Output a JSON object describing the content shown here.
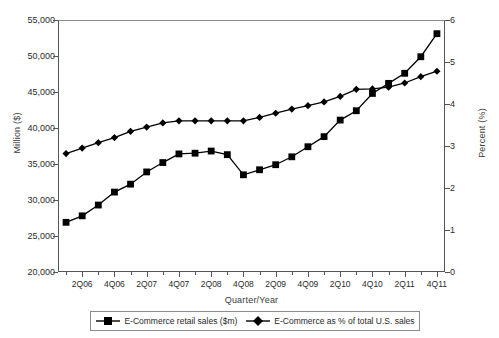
{
  "chart_data": {
    "type": "line",
    "title": "",
    "xlabel": "Quarter/Year",
    "ylabel": "Million ($)",
    "y2label": "Percent (%)",
    "ylim": [
      20000,
      55000
    ],
    "y2lim": [
      0,
      6
    ],
    "ytick_labels": [
      "55,000",
      "50,000",
      "45,000",
      "40,000",
      "35,000",
      "30,000",
      "25,000",
      "20,000"
    ],
    "ytick_values": [
      55000,
      50000,
      45000,
      40000,
      35000,
      30000,
      25000,
      20000
    ],
    "y2tick_labels": [
      "6",
      "5",
      "4",
      "3",
      "2",
      "1",
      "0"
    ],
    "y2tick_values": [
      6,
      5,
      4,
      3,
      2,
      1,
      0
    ],
    "grid": false,
    "legend_position": "bottom",
    "x": [
      "1Q06",
      "2Q06",
      "3Q06",
      "4Q06",
      "1Q07",
      "2Q07",
      "3Q07",
      "4Q07",
      "1Q08",
      "2Q08",
      "3Q08",
      "4Q08",
      "1Q09",
      "2Q09",
      "3Q09",
      "4Q09",
      "1Q10",
      "2Q10",
      "3Q10",
      "4Q10",
      "1Q11",
      "2Q11",
      "3Q11",
      "4Q11"
    ],
    "xtick_labels": [
      "2Q06",
      "4Q06",
      "2Q07",
      "4Q07",
      "2Q08",
      "4Q08",
      "2Q09",
      "4Q09",
      "2Q10",
      "4Q10",
      "2Q11",
      "4Q11"
    ],
    "xtick_label_indices": [
      1,
      3,
      5,
      7,
      9,
      11,
      13,
      15,
      17,
      19,
      21,
      23
    ],
    "series": [
      {
        "name": "E-Commerce retail sales ($m)",
        "axis": "left",
        "marker": "square",
        "color": "#000000",
        "values": [
          26900,
          27800,
          29300,
          31100,
          32200,
          33900,
          35200,
          36400,
          36500,
          36800,
          36300,
          33500,
          34200,
          34900,
          36000,
          37400,
          38800,
          41100,
          42400,
          44800,
          46200,
          47600,
          49900,
          53100
        ]
      },
      {
        "name": "E-Commerce as % of total U.S. sales",
        "axis": "right",
        "marker": "diamond",
        "color": "#000000",
        "values": [
          2.82,
          2.95,
          3.08,
          3.2,
          3.35,
          3.45,
          3.55,
          3.6,
          3.6,
          3.6,
          3.6,
          3.6,
          3.68,
          3.78,
          3.88,
          3.96,
          4.05,
          4.18,
          4.35,
          4.36,
          4.4,
          4.5,
          4.65,
          4.78
        ]
      }
    ]
  },
  "legend": {
    "items": [
      {
        "label": "E-Commerce retail sales ($m)",
        "marker": "square"
      },
      {
        "label": "E-Commerce as % of total U.S. sales",
        "marker": "diamond"
      }
    ]
  }
}
